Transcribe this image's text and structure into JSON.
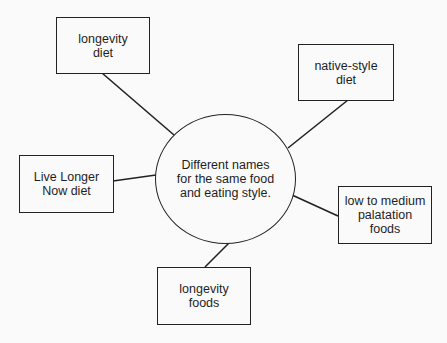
{
  "diagram": {
    "type": "hub-and-spoke",
    "center": {
      "label": "Different names\nfor the same food\nand eating style.",
      "shape": "ellipse"
    },
    "nodes": [
      {
        "id": "longevity-diet",
        "label": "longevity\ndiet"
      },
      {
        "id": "native-style-diet",
        "label": "native-style\ndiet"
      },
      {
        "id": "live-longer-now-diet",
        "label": "Live Longer\nNow diet"
      },
      {
        "id": "low-to-medium-palatation-foods",
        "label": "low to medium\npalatation\nfoods"
      },
      {
        "id": "longevity-foods",
        "label": "longevity\nfoods"
      }
    ],
    "edges": [
      {
        "from": "center",
        "to": "longevity-diet"
      },
      {
        "from": "center",
        "to": "native-style-diet"
      },
      {
        "from": "center",
        "to": "live-longer-now-diet"
      },
      {
        "from": "center",
        "to": "low-to-medium-palatation-foods"
      },
      {
        "from": "center",
        "to": "longevity-foods"
      }
    ],
    "colors": {
      "stroke": "#222222",
      "text": "#1e1e1e",
      "background": "#fafafa"
    }
  }
}
